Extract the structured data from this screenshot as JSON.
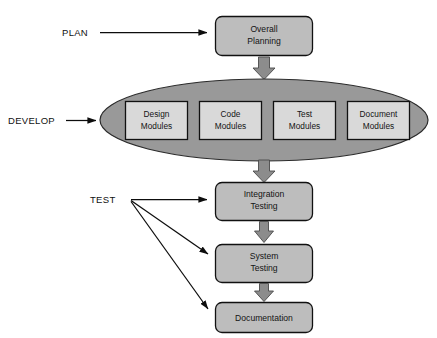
{
  "diagram": {
    "colors": {
      "background": "#ffffff",
      "rounded_box_fill": "#bdbdbd",
      "ellipse_fill": "#999999",
      "module_box_fill": "#d9d9d9",
      "block_arrow_fill": "#8c8c8c",
      "outline": "#111111",
      "text": "#141414"
    },
    "stage_labels": [
      {
        "id": "plan",
        "text": "PLAN"
      },
      {
        "id": "develop",
        "text": "DEVELOP"
      },
      {
        "id": "test",
        "text": "TEST"
      }
    ],
    "nodes": [
      {
        "id": "overall-planning",
        "shape": "rounded-rect",
        "lines": [
          "Overall",
          "Planning"
        ]
      },
      {
        "id": "integration-testing",
        "shape": "rounded-rect",
        "lines": [
          "Integration",
          "Testing"
        ]
      },
      {
        "id": "system-testing",
        "shape": "rounded-rect",
        "lines": [
          "System",
          "Testing"
        ]
      },
      {
        "id": "documentation",
        "shape": "rounded-rect",
        "lines": [
          "Documentation"
        ]
      }
    ],
    "develop_phase": {
      "shape": "ellipse",
      "modules": [
        {
          "id": "design-modules",
          "lines": [
            "Design",
            "Modules"
          ]
        },
        {
          "id": "code-modules",
          "lines": [
            "Code",
            "Modules"
          ]
        },
        {
          "id": "test-modules",
          "lines": [
            "Test",
            "Modules"
          ]
        },
        {
          "id": "document-modules",
          "lines": [
            "Document",
            "Modules"
          ]
        }
      ]
    },
    "connectors": [
      {
        "id": "plan-to-overall-planning",
        "kind": "thin-arrow",
        "from": "PLAN",
        "to": "Overall Planning"
      },
      {
        "id": "overall-planning-to-develop",
        "kind": "block-arrow",
        "from": "Overall Planning",
        "to": "Develop phase"
      },
      {
        "id": "develop-label-to-ellipse",
        "kind": "thin-arrow",
        "from": "DEVELOP",
        "to": "Develop phase"
      },
      {
        "id": "develop-to-integration-testing",
        "kind": "block-arrow",
        "from": "Develop phase",
        "to": "Integration Testing"
      },
      {
        "id": "test-to-integration-testing",
        "kind": "thin-arrow",
        "from": "TEST",
        "to": "Integration Testing"
      },
      {
        "id": "test-to-system-testing",
        "kind": "thin-arrow",
        "from": "TEST",
        "to": "System Testing"
      },
      {
        "id": "test-to-documentation",
        "kind": "thin-arrow",
        "from": "TEST",
        "to": "Documentation"
      },
      {
        "id": "integration-to-system-testing",
        "kind": "block-arrow",
        "from": "Integration Testing",
        "to": "System Testing"
      },
      {
        "id": "system-testing-to-documentation",
        "kind": "block-arrow",
        "from": "System Testing",
        "to": "Documentation"
      }
    ]
  }
}
